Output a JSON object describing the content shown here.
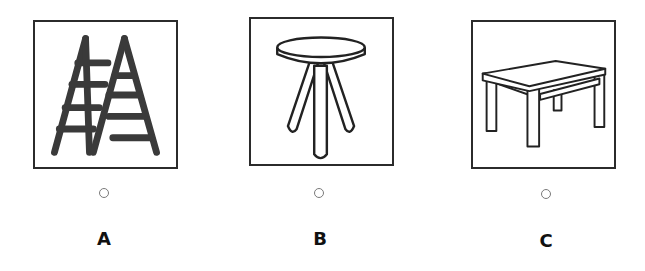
{
  "options": [
    {
      "letter": "A",
      "image": "ladder-icon",
      "description": "Step ladder"
    },
    {
      "letter": "B",
      "image": "stool-icon",
      "description": "Three-legged stool"
    },
    {
      "letter": "C",
      "image": "table-icon",
      "description": "Table"
    }
  ],
  "colors": {
    "stroke": "#2b2b2b",
    "radio": "#7a7a7a",
    "label": "#111111"
  }
}
